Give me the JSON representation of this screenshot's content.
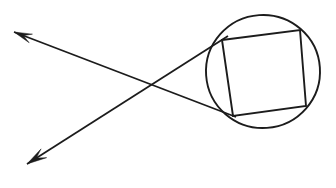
{
  "figure": {
    "type": "geometry-diagram",
    "canvas": {
      "width": 336,
      "height": 188
    },
    "background_color": "#ffffff",
    "ink_color": "#1c1c1c"
  },
  "circle": {
    "name": "circle",
    "center_x": 263,
    "center_y": 71.5,
    "radius_x": 57,
    "radius_y": 56.5,
    "rotation_deg": -4,
    "stroke_width": 1.9
  },
  "quadrilateral": {
    "name": "inscribed-quadrilateral",
    "vertices": [
      {
        "label": "top-left",
        "x": 222,
        "y": 40
      },
      {
        "label": "top-right",
        "x": 300,
        "y": 30
      },
      {
        "label": "bottom-right",
        "x": 306,
        "y": 106
      },
      {
        "label": "bottom-left",
        "x": 233,
        "y": 116
      }
    ],
    "stroke_width": 1.9,
    "closed": true
  },
  "secants": [
    {
      "name": "secant-upper-left-to-circle",
      "description": "Ray with arrowhead at upper left, running down-right to the circle's lower-left point",
      "arrow_tip_x": 14,
      "arrow_tip_y": 32,
      "end_x": 236,
      "end_y": 117,
      "stroke_width": 1.8,
      "arrowhead": {
        "position": "start",
        "length": 18,
        "half_width": 4.6
      }
    },
    {
      "name": "secant-lower-left-to-circle",
      "description": "Ray with arrowhead at lower left, running up-right to the circle's upper-left point",
      "arrow_tip_x": 27,
      "arrow_tip_y": 164,
      "end_x": 228,
      "end_y": 36,
      "stroke_width": 1.8,
      "arrowhead": {
        "position": "start",
        "length": 20,
        "half_width": 5.2
      }
    }
  ],
  "intersection_point": {
    "name": "secant-crossing-point",
    "x": 145,
    "y": 87,
    "visible_marker": false
  },
  "labels": []
}
